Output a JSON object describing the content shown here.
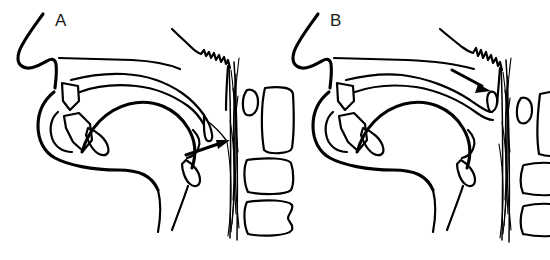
{
  "figure": {
    "background_color": "#ffffff",
    "ink_color": "#000000",
    "width": 550,
    "height": 260,
    "panel_count": 2
  },
  "panels": [
    {
      "id": "A",
      "label": "A",
      "label_x": 55,
      "label_y": 26,
      "caption": "Soft palate lowered — velopharyngeal port open (nasal breathing / nasal consonant)",
      "arrow": {
        "name": "velopharyngeal-port-arrow",
        "direction": "right-up",
        "tail_x": 186,
        "tail_y": 154,
        "tip_x": 228,
        "tip_y": 141,
        "points_to": "open velopharyngeal port"
      },
      "structures": [
        "nasal-profile",
        "hard-palate",
        "soft-palate-lowered",
        "uvula",
        "adenoid-pad",
        "upper-incisors",
        "lower-incisors",
        "tongue",
        "mandible",
        "epiglottis",
        "posterior-pharyngeal-wall",
        "cervical-vertebrae"
      ],
      "vertebrae_count": 3
    },
    {
      "id": "B",
      "label": "B",
      "label_x": 330,
      "label_y": 26,
      "caption": "Soft palate elevated against posterior pharyngeal wall — velopharyngeal port closed",
      "arrow": {
        "name": "velopharyngeal-closure-arrow",
        "direction": "down-right",
        "tail_x": 452,
        "tail_y": 70,
        "tip_x": 489,
        "tip_y": 90,
        "points_to": "point of velopharyngeal closure"
      },
      "structures": [
        "nasal-profile",
        "hard-palate",
        "soft-palate-elevated",
        "adenoid-pad",
        "upper-incisors",
        "lower-incisors",
        "tongue",
        "mandible",
        "epiglottis",
        "posterior-pharyngeal-wall",
        "cervical-vertebrae"
      ],
      "vertebrae_count": 3
    }
  ]
}
